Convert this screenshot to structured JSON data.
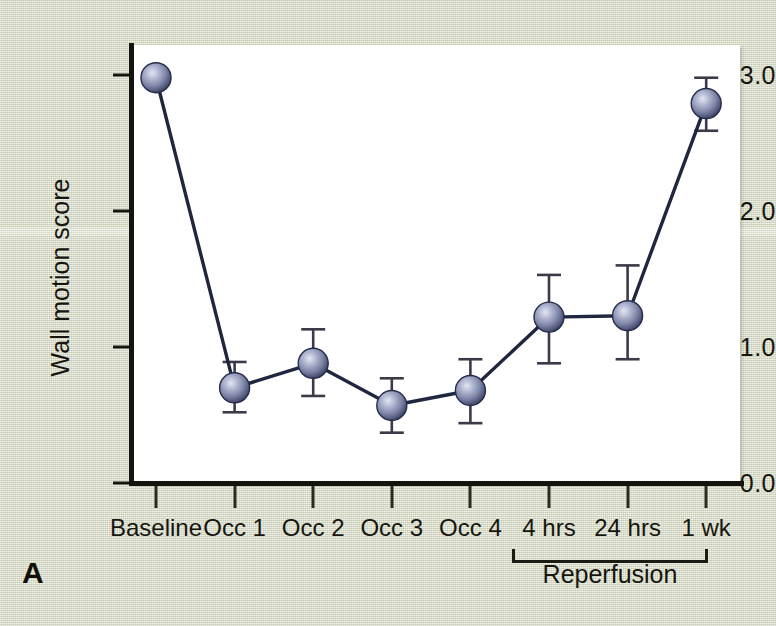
{
  "panel": {
    "letter": "A"
  },
  "chart_data": {
    "type": "line",
    "title": "",
    "xlabel": "",
    "ylabel": "Wall motion score",
    "ylim": [
      0.0,
      3.2
    ],
    "yticks": [
      0.0,
      1.0,
      2.0,
      3.0
    ],
    "ytick_labels": [
      "0.0",
      "1.0",
      "2.0",
      "3.0"
    ],
    "grid": false,
    "legend": "none",
    "categories": [
      "Baseline",
      "Occ 1",
      "Occ 2",
      "Occ 3",
      "Occ 4",
      "4 hrs",
      "24 hrs",
      "1 wk"
    ],
    "values": [
      2.98,
      0.7,
      0.88,
      0.57,
      0.68,
      1.22,
      1.23,
      2.79
    ],
    "error_low": [
      0.0,
      0.18,
      0.24,
      0.2,
      0.24,
      0.34,
      0.32,
      0.2
    ],
    "error_high": [
      0.0,
      0.19,
      0.25,
      0.2,
      0.23,
      0.31,
      0.37,
      0.19
    ],
    "annotations": [
      {
        "text": "Reperfusion",
        "spans_categories": [
          "4 hrs",
          "24 hrs",
          "1 wk"
        ],
        "style": "bracket-below-axis"
      }
    ],
    "marker": {
      "shape": "sphere",
      "fill": "#7f86a6",
      "highlight": "#c3c8de",
      "edge": "#262c4c"
    },
    "line_color": "#20263f",
    "errorbar_color": "#3a3a48",
    "plot_background": "#ffffff",
    "figure_background": "#d8dbc6"
  }
}
